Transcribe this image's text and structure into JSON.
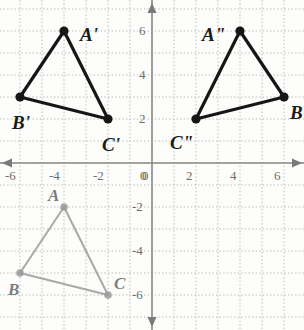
{
  "figure": {
    "kind": "coordinate-plane-triangles",
    "width": 304,
    "height": 330,
    "origin_px": {
      "x": 152,
      "y": 163
    },
    "unit_px": 22,
    "grid": {
      "minor_step": 1,
      "major_step": 2,
      "minor_style": "dotted",
      "major_style": "solid",
      "minor_color": "#b9b9b9",
      "major_color": "#c9c9c9",
      "axis_color": "#8a8a8a"
    },
    "xlim": [
      -7,
      7
    ],
    "ylim": [
      -7,
      7
    ]
  },
  "chart_data": {
    "type": "scatter",
    "title": "",
    "xlabel": "",
    "ylabel": "",
    "xlim": [
      -7,
      7
    ],
    "ylim": [
      -7,
      7
    ],
    "grid": true,
    "legend": "none",
    "x_ticks": [
      -6,
      -4,
      -2,
      0,
      2,
      4,
      6
    ],
    "y_ticks": [
      6,
      4,
      2,
      0,
      -2,
      -4,
      -6
    ],
    "x_tick_labels": [
      "-6",
      "-4",
      "-2",
      "0",
      "2",
      "4",
      "6"
    ],
    "y_tick_labels": [
      "6",
      "4",
      "2",
      "0",
      "-2",
      "-4",
      "-6"
    ],
    "series": [
      {
        "name": "triangle-ABC",
        "style": "gray-outline",
        "color": "#9a9a9a",
        "closed": true,
        "points": [
          {
            "label": "A",
            "x": -4,
            "y": -2
          },
          {
            "label": "B",
            "x": -6,
            "y": -5
          },
          {
            "label": "C",
            "x": -2,
            "y": -6
          }
        ]
      },
      {
        "name": "triangle-A-prime-B-prime-C-prime",
        "style": "black-bold",
        "color": "#161616",
        "closed": true,
        "points": [
          {
            "label": "A'",
            "x": -4,
            "y": 6
          },
          {
            "label": "B'",
            "x": -6,
            "y": 3
          },
          {
            "label": "C'",
            "x": -2,
            "y": 2
          }
        ]
      },
      {
        "name": "triangle-A-double-prime-B-double-prime-C-double-prime",
        "style": "black-bold",
        "color": "#161616",
        "closed": true,
        "points": [
          {
            "label": "A\"",
            "x": 4,
            "y": 6
          },
          {
            "label": "B\"",
            "x": 6,
            "y": 3
          },
          {
            "label": "C\"",
            "x": 2,
            "y": 2
          }
        ]
      }
    ]
  },
  "x_axis": {
    "labels": [
      {
        "text": "-6",
        "x": -6
      },
      {
        "text": "-4",
        "x": -4
      },
      {
        "text": "-2",
        "x": -2
      },
      {
        "text": "0",
        "x": 0
      },
      {
        "text": "2",
        "x": 2
      },
      {
        "text": "4",
        "x": 4
      },
      {
        "text": "6",
        "x": 6
      }
    ]
  },
  "y_axis": {
    "labels": [
      {
        "text": "6",
        "y": 6
      },
      {
        "text": "4",
        "y": 4
      },
      {
        "text": "2",
        "y": 2
      },
      {
        "text": "-2",
        "y": -2
      },
      {
        "text": "-4",
        "y": -4
      },
      {
        "text": "-6",
        "y": -6
      }
    ]
  },
  "vertex_labels": [
    {
      "text": "A'",
      "x": -4,
      "y": 6,
      "dx": 16,
      "dy": -6,
      "cls": "prime"
    },
    {
      "text": "B'",
      "x": -6,
      "y": 3,
      "dx": -8,
      "dy": 16,
      "cls": "prime"
    },
    {
      "text": "C'",
      "x": -2,
      "y": 2,
      "dx": -6,
      "dy": 16,
      "cls": "prime"
    },
    {
      "text": "A\"",
      "x": 4,
      "y": 6,
      "dx": -38,
      "dy": -6,
      "cls": "prime"
    },
    {
      "text": "B\"",
      "x": 6,
      "y": 3,
      "dx": 6,
      "dy": 6,
      "cls": "prime"
    },
    {
      "text": "C\"",
      "x": 2,
      "y": 2,
      "dx": -26,
      "dy": 14,
      "cls": "prime"
    },
    {
      "text": "A",
      "x": -4,
      "y": -2,
      "dx": -16,
      "dy": -20,
      "cls": "orig"
    },
    {
      "text": "B",
      "x": -6,
      "y": -5,
      "dx": -12,
      "dy": 8,
      "cls": "orig"
    },
    {
      "text": "C",
      "x": -2,
      "y": -6,
      "dx": 6,
      "dy": -20,
      "cls": "orig"
    }
  ]
}
